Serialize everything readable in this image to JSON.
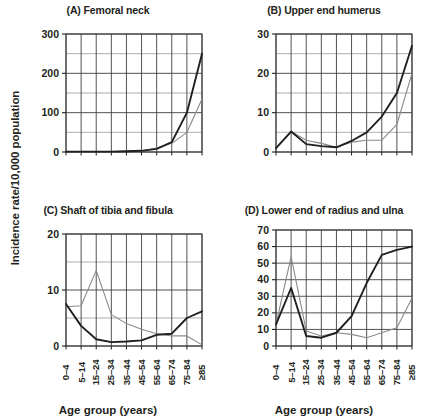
{
  "figure": {
    "ylabel": "Incidence rate/10,000 population",
    "xlabel": "Age group (years)",
    "categories": [
      "0–4",
      "5–14",
      "15–24",
      "25–34",
      "35–44",
      "45–54",
      "55–64",
      "65–74",
      "75–84",
      "≥85"
    ],
    "series_colors": {
      "dark": "#231f20",
      "light": "#8a8a8a"
    },
    "grid_color": "#404040",
    "background": "#ffffff"
  },
  "chart_data": [
    {
      "type": "line",
      "panel": "A",
      "title": "(A) Femoral neck",
      "xlabel": "Age group (years)",
      "ylabel": "Incidence rate/10,000 population",
      "categories": [
        "0–4",
        "5–14",
        "15–24",
        "25–34",
        "35–44",
        "45–54",
        "55–64",
        "65–74",
        "75–84",
        "≥85"
      ],
      "yticks": [
        0,
        100,
        200,
        300
      ],
      "ytick_labels": [
        "0",
        "100",
        "200",
        "300"
      ],
      "minor_ystep": 50,
      "ylim": [
        0,
        300
      ],
      "grid": true,
      "legend": "none",
      "series": [
        {
          "name": "dark",
          "values": [
            1,
            1,
            1,
            1,
            2,
            3,
            8,
            25,
            100,
            250
          ]
        },
        {
          "name": "light",
          "values": [
            1,
            1,
            1,
            1,
            2,
            3,
            10,
            22,
            50,
            135
          ]
        }
      ]
    },
    {
      "type": "line",
      "panel": "B",
      "title": "(B) Upper end humerus",
      "xlabel": "Age group (years)",
      "ylabel": "Incidence rate/10,000 population",
      "categories": [
        "0–4",
        "5–14",
        "15–24",
        "25–34",
        "35–44",
        "45–54",
        "55–64",
        "65–74",
        "75–84",
        "≥85"
      ],
      "yticks": [
        0,
        10,
        20,
        30
      ],
      "ytick_labels": [
        "0",
        "10",
        "20",
        "30"
      ],
      "minor_ystep": 5,
      "ylim": [
        0,
        30
      ],
      "grid": true,
      "legend": "none",
      "series": [
        {
          "name": "dark",
          "values": [
            1.0,
            5.2,
            2.0,
            1.5,
            1.2,
            2.8,
            5.0,
            9.0,
            15.0,
            27.0
          ]
        },
        {
          "name": "light",
          "values": [
            1.0,
            5.2,
            3.0,
            2.2,
            1.2,
            2.5,
            3.0,
            3.0,
            7.0,
            20.0
          ]
        }
      ]
    },
    {
      "type": "line",
      "panel": "C",
      "title": "(C) Shaft of tibia and fibula",
      "xlabel": "Age group (years)",
      "ylabel": "Incidence rate/10,000 population",
      "categories": [
        "0–4",
        "5–14",
        "15–24",
        "25–34",
        "35–44",
        "45–54",
        "55–64",
        "65–74",
        "75–84",
        "≥85"
      ],
      "yticks": [
        0,
        10,
        20
      ],
      "ytick_labels": [
        "0",
        "10",
        "20"
      ],
      "minor_ystep": 5,
      "ylim": [
        0,
        20
      ],
      "grid": true,
      "legend": "none",
      "series": [
        {
          "name": "dark",
          "values": [
            7.5,
            3.6,
            1.2,
            0.7,
            0.8,
            1.0,
            2.0,
            2.2,
            5.0,
            6.2
          ]
        },
        {
          "name": "light",
          "values": [
            7.0,
            7.2,
            13.5,
            5.6,
            4.0,
            3.0,
            2.2,
            1.8,
            1.8,
            0.2
          ]
        }
      ]
    },
    {
      "type": "line",
      "panel": "D",
      "title": "(D) Lower end of radius and ulna",
      "xlabel": "Age group (years)",
      "ylabel": "Incidence rate/10,000 population",
      "categories": [
        "0–4",
        "5–14",
        "15–24",
        "25–34",
        "35–44",
        "45–54",
        "55–64",
        "65–74",
        "75–84",
        "≥85"
      ],
      "yticks": [
        0,
        10,
        20,
        30,
        40,
        50,
        60,
        70
      ],
      "ytick_labels": [
        "0",
        "10",
        "20",
        "30",
        "40",
        "50",
        "60",
        "70"
      ],
      "minor_ystep": 10,
      "ylim": [
        0,
        70
      ],
      "grid": true,
      "legend": "none",
      "series": [
        {
          "name": "dark",
          "values": [
            13,
            35,
            6,
            5,
            8,
            18,
            38,
            55,
            58,
            60
          ]
        },
        {
          "name": "light",
          "values": [
            13,
            54,
            9,
            6,
            8,
            7,
            5,
            8,
            11,
            29
          ]
        }
      ]
    }
  ]
}
